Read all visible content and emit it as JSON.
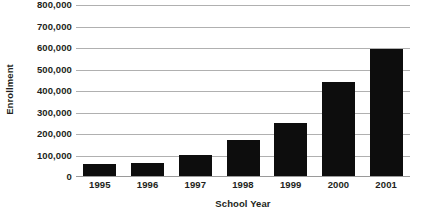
{
  "chart_data": {
    "type": "bar",
    "title": "",
    "subtitle": "",
    "xlabel": "School Year",
    "ylabel": "Enrollment",
    "categories": [
      "1995",
      "1996",
      "1997",
      "1998",
      "1999",
      "2000",
      "2001"
    ],
    "values": [
      62000,
      67000,
      102000,
      170000,
      250000,
      440000,
      595000
    ],
    "series": [
      {
        "name": "Enrollment",
        "values": [
          62000,
          67000,
          102000,
          170000,
          250000,
          440000,
          595000
        ],
        "color": "#0d0d0d"
      }
    ],
    "ylim": [
      0,
      800000
    ],
    "ytick_values": [
      0,
      100000,
      200000,
      300000,
      400000,
      500000,
      600000,
      700000,
      800000
    ],
    "ytick_labels": [
      "0",
      "100,000",
      "200,000",
      "300,000",
      "400,000",
      "500,000",
      "600,000",
      "700,000",
      "800,000"
    ],
    "grid": true,
    "grid_axis": "y",
    "grid_color": "#b0b0b0",
    "legend": false,
    "legend_position": "none",
    "bar_color": "#0d0d0d",
    "background_color": "#ffffff",
    "text_color": "#231f20",
    "annotations": []
  }
}
